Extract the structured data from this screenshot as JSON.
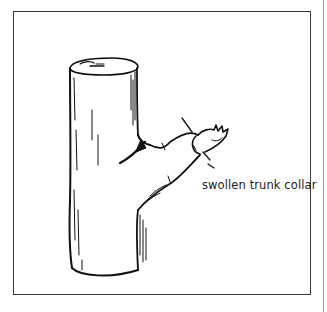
{
  "figure": {
    "type": "line-drawing",
    "annotations": [
      {
        "id": "collar",
        "text": "swollen trunk collar"
      }
    ],
    "caption_text": ""
  },
  "colors": {
    "ink": "#111111",
    "frame": "#3a3a3a",
    "background": "#ffffff"
  }
}
